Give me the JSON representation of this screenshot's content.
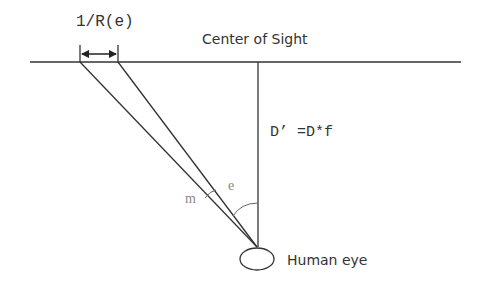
{
  "diagram": {
    "labels": {
      "resolution": "1/R(e)",
      "center_of_sight": "Center of Sight",
      "distance": "D’ =D*f",
      "angle_e": "e",
      "angle_m": "m",
      "human_eye": "Human eye"
    },
    "colors": {
      "line": "#333333",
      "text": "#333333",
      "light_text": "#888888"
    }
  }
}
